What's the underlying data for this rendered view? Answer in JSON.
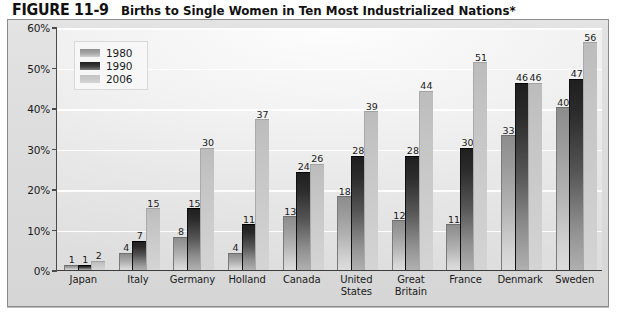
{
  "figure": {
    "label": "FIGURE 11-9",
    "title": "Births to Single Women in Ten Most Industrialized Nations*"
  },
  "legend": {
    "position": "top-left-inside",
    "entries": [
      {
        "label": "1980",
        "swatch": "medium-gray-gradient"
      },
      {
        "label": "1990",
        "swatch": "dark-gray-gradient"
      },
      {
        "label": "2006",
        "swatch": "light-gray-gradient"
      }
    ]
  },
  "chart_data": {
    "type": "bar",
    "title": "Births to Single Women in Ten Most Industrialized Nations*",
    "xlabel": "",
    "ylabel": "",
    "ylim": [
      0,
      60
    ],
    "ytick_labels": [
      "0%",
      "10%",
      "20%",
      "30%",
      "40%",
      "50%",
      "60%"
    ],
    "ytick_values": [
      0,
      10,
      20,
      30,
      40,
      50,
      60
    ],
    "grid": true,
    "legend_position": "upper left",
    "categories": [
      "Japan",
      "Italy",
      "Germany",
      "Holland",
      "Canada",
      "United States",
      "Great Britain",
      "France",
      "Denmark",
      "Sweden"
    ],
    "series": [
      {
        "name": "1980",
        "color": "#9a9a9a",
        "values": [
          1,
          4,
          8,
          4,
          13,
          18,
          12,
          11,
          33,
          40
        ]
      },
      {
        "name": "1990",
        "color": "#2c2c2c",
        "values": [
          1,
          7,
          15,
          11,
          24,
          28,
          28,
          30,
          46,
          47
        ]
      },
      {
        "name": "2006",
        "color": "#c8c8c8",
        "values": [
          2,
          15,
          30,
          37,
          26,
          39,
          44,
          51,
          46,
          56
        ]
      }
    ]
  },
  "category_label_lines": [
    [
      "Japan"
    ],
    [
      "Italy"
    ],
    [
      "Germany"
    ],
    [
      "Holland"
    ],
    [
      "Canada"
    ],
    [
      "United",
      "States"
    ],
    [
      "Great",
      "Britain"
    ],
    [
      "France"
    ],
    [
      "Denmark"
    ],
    [
      "Sweden"
    ]
  ]
}
